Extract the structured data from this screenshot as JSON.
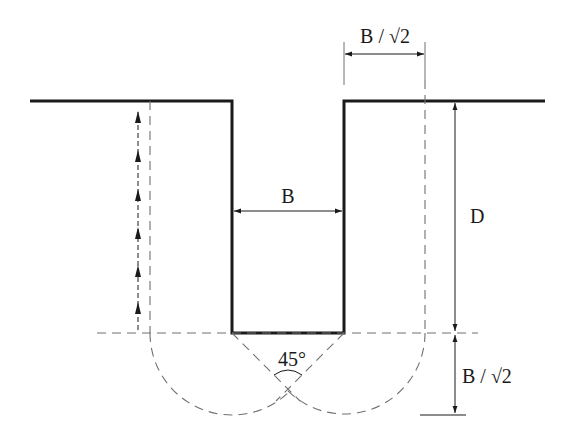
{
  "diagram": {
    "labels": {
      "top_width": "B / √2",
      "trench_width": "B",
      "depth": "D",
      "bottom_depth": "B / √2",
      "angle": "45°"
    },
    "colors": {
      "line": "#1a1a1a",
      "dashed": "#707070",
      "background": "#ffffff"
    }
  }
}
